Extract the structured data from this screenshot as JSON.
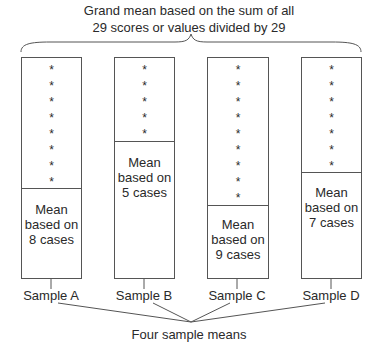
{
  "title": {
    "line1": "Grand mean based on the sum of all",
    "line2": "29 scores or values divided by 29"
  },
  "samples": [
    {
      "label": "Sample A",
      "cases": 8,
      "mean_line1": "Mean",
      "mean_line2": "based on",
      "mean_line3": "8 cases"
    },
    {
      "label": "Sample B",
      "cases": 5,
      "mean_line1": "Mean",
      "mean_line2": "based on",
      "mean_line3": "5 cases"
    },
    {
      "label": "Sample C",
      "cases": 9,
      "mean_line1": "Mean",
      "mean_line2": "based on",
      "mean_line3": "9 cases"
    },
    {
      "label": "Sample D",
      "cases": 7,
      "mean_line1": "Mean",
      "mean_line2": "based on",
      "mean_line3": "7 cases"
    }
  ],
  "star_glyph": "*",
  "total_cases": 29,
  "footer": "Four sample means",
  "colors": {
    "line": "#555555",
    "text": "#2a2a2a"
  }
}
